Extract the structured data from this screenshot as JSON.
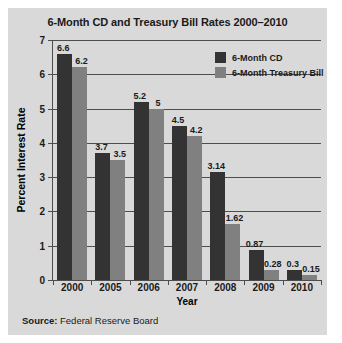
{
  "figure": {
    "background_color": "#d9d9d9",
    "source_prefix": "Source:",
    "source_text": " Federal Reserve Board"
  },
  "legend": {
    "position": "top-right",
    "entries": [
      {
        "label": "6-Month CD",
        "color": "#333333"
      },
      {
        "label": "6-Month Treasury Bill",
        "color": "#808080"
      }
    ]
  },
  "chart_data": {
    "type": "bar",
    "title": "6-Month CD and Treasury Bill Rates 2000–2010",
    "xlabel": "Year",
    "ylabel": "Percent Interest Rate",
    "categories": [
      "2000",
      "2005",
      "2006",
      "2007",
      "2008",
      "2009",
      "2010"
    ],
    "series": [
      {
        "name": "6-Month CD",
        "color": "#333333",
        "values": [
          6.6,
          3.7,
          5.2,
          4.5,
          3.14,
          0.87,
          0.3
        ],
        "labels": [
          "6.6",
          "3.7",
          "5.2",
          "4.5",
          "3.14",
          "0.87",
          "0.3"
        ]
      },
      {
        "name": "6-Month Treasury Bill",
        "color": "#808080",
        "values": [
          6.2,
          3.5,
          5,
          4.2,
          1.62,
          0.28,
          0.15
        ],
        "labels": [
          "6.2",
          "3.5",
          "5",
          "4.2",
          "1.62",
          "0.28",
          "0.15"
        ]
      }
    ],
    "ylim": [
      0,
      7
    ],
    "yticks": [
      0,
      1,
      2,
      3,
      4,
      5,
      6,
      7
    ],
    "ytick_labels": [
      "0",
      "1",
      "2",
      "3",
      "4",
      "5",
      "6",
      "7"
    ],
    "grid": true,
    "grid_axis": "y"
  }
}
